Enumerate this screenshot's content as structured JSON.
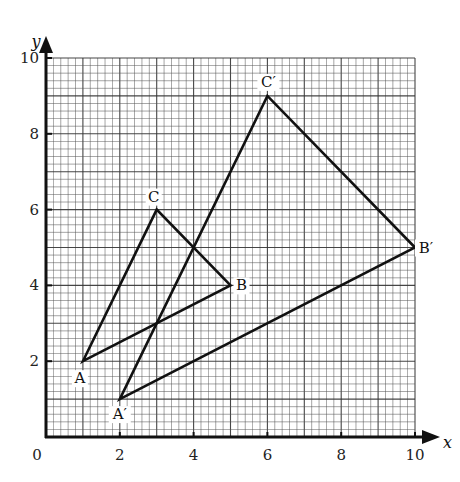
{
  "chart_data": {
    "type": "diagram-coordinate-geometry",
    "title": "",
    "xlabel": "x",
    "ylabel": "y",
    "xlim": [
      0,
      10
    ],
    "ylim": [
      0,
      10
    ],
    "x_ticks": [
      0,
      2,
      4,
      6,
      8,
      10
    ],
    "y_ticks": [
      2,
      4,
      6,
      8,
      10
    ],
    "origin_label": "0",
    "grid": {
      "on": true,
      "minor_per_unit": 5
    },
    "series": [
      {
        "name": "Triangle ABC",
        "vertices": [
          {
            "label": "A",
            "x": 1,
            "y": 2
          },
          {
            "label": "B",
            "x": 5,
            "y": 4
          },
          {
            "label": "C",
            "x": 3,
            "y": 6
          }
        ]
      },
      {
        "name": "Triangle A'B'C'",
        "vertices": [
          {
            "label": "A′",
            "x": 2,
            "y": 1
          },
          {
            "label": "B′",
            "x": 10,
            "y": 5
          },
          {
            "label": "C′",
            "x": 6,
            "y": 9
          }
        ]
      }
    ]
  },
  "labels": {
    "x_axis": "x",
    "y_axis": "y",
    "origin": "0",
    "x_ticks": [
      "2",
      "4",
      "6",
      "8",
      "10"
    ],
    "y_ticks": [
      "2",
      "4",
      "6",
      "8",
      "10"
    ],
    "A": "A",
    "B": "B",
    "C": "C",
    "A_prime": "A′",
    "B_prime": "B′",
    "C_prime": "C′"
  },
  "colors": {
    "line": "#111111",
    "grid_minor": "#555555",
    "grid_major": "#333333",
    "background": "#ffffff"
  }
}
